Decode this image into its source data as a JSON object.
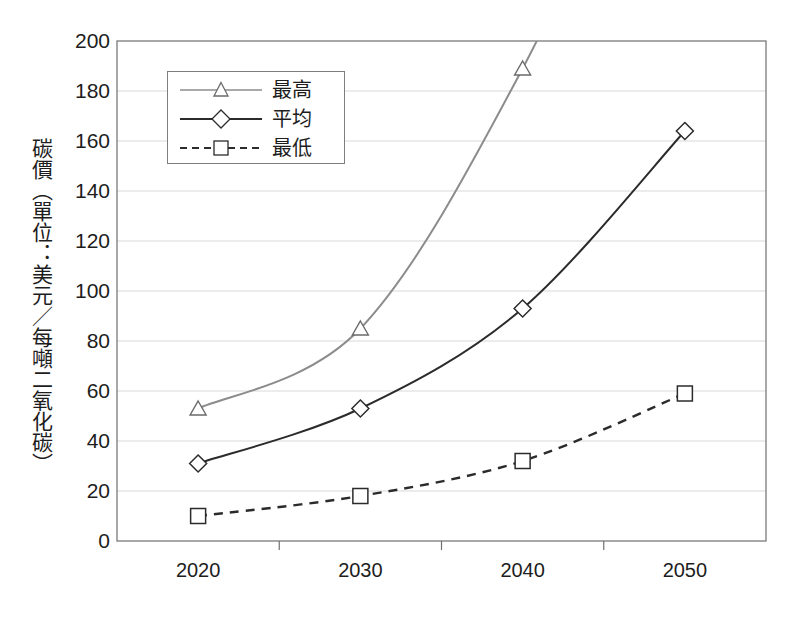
{
  "chart_data": {
    "type": "line",
    "title": "",
    "subtitle": "",
    "xlabel": "",
    "ylabel": "碳價（單位：美元／每噸二氧化碳）",
    "categories": [
      "2020",
      "2030",
      "2040",
      "2050"
    ],
    "x": [
      2020,
      2030,
      2040,
      2050
    ],
    "ylim": [
      0,
      200
    ],
    "yticks": [
      0,
      20,
      40,
      60,
      80,
      100,
      120,
      140,
      160,
      180,
      200
    ],
    "ytick_labels": [
      "0",
      "20",
      "40",
      "60",
      "80",
      "100",
      "120",
      "140",
      "160",
      "180",
      "200"
    ],
    "grid": "horizontal",
    "legend_position": "upper-left-inside",
    "series": [
      {
        "name": "最高",
        "marker": "triangle",
        "line_style": "solid",
        "color": "#8c8c8c",
        "values": [
          53,
          85,
          189,
          330
        ],
        "clipped_above_axis_max": true,
        "note": "line exits top of plot between 2040 and 2050"
      },
      {
        "name": "平均",
        "marker": "diamond",
        "line_style": "solid",
        "color": "#2b2b2b",
        "values": [
          31,
          53,
          93,
          164
        ]
      },
      {
        "name": "最低",
        "marker": "square",
        "line_style": "dashed",
        "color": "#2b2b2b",
        "values": [
          10,
          18,
          32,
          59
        ]
      }
    ]
  },
  "legend": {
    "items": [
      {
        "label": "最高"
      },
      {
        "label": "平均"
      },
      {
        "label": "最低"
      }
    ]
  },
  "colors": {
    "series_high": "#8c8c8c",
    "series_avg": "#2b2b2b",
    "series_low": "#2b2b2b",
    "grid": "#d9d9d9",
    "frame": "#6f6f6f",
    "text": "#1d1d1d",
    "background": "#ffffff"
  }
}
